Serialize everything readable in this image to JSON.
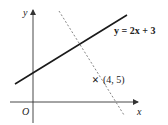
{
  "diagram": {
    "axes": {
      "x_label": "x",
      "y_label": "y",
      "origin_label": "O"
    },
    "solid_line": {
      "equation_label": "y = 2x + 3"
    },
    "dashed_line": {
      "description": "perpendicular line through point"
    },
    "point": {
      "marker": "×",
      "label": "(4, 5)"
    },
    "colors": {
      "axis": "#333333",
      "solid_line": "#1a1a1a",
      "dashed_line": "#777777"
    }
  }
}
